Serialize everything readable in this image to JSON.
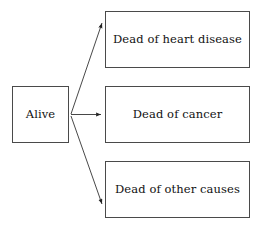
{
  "diagram": {
    "background_color": "#ffffff",
    "line_color": "#333333",
    "border_color": "#4a4a4a",
    "text_color": "#111111",
    "nodes": [
      {
        "id": "alive",
        "label": "Alive",
        "x": 12,
        "y": 86,
        "w": 57,
        "h": 57
      },
      {
        "id": "heart",
        "label": "Dead of heart disease",
        "x": 105,
        "y": 11,
        "w": 145,
        "h": 57
      },
      {
        "id": "cancer",
        "label": "Dead of cancer",
        "x": 105,
        "y": 86,
        "w": 145,
        "h": 57
      },
      {
        "id": "other",
        "label": "Dead of other causes",
        "x": 105,
        "y": 161,
        "w": 145,
        "h": 57
      }
    ],
    "edges": [
      {
        "id": "alive-to-heart",
        "from": "alive",
        "to": "heart",
        "x1": 71,
        "y1": 114,
        "x2": 103,
        "y2": 22
      },
      {
        "id": "alive-to-cancer",
        "from": "alive",
        "to": "cancer",
        "x1": 71,
        "y1": 114,
        "x2": 103,
        "y2": 114
      },
      {
        "id": "alive-to-other",
        "from": "alive",
        "to": "other",
        "x1": 71,
        "y1": 116,
        "x2": 103,
        "y2": 205
      }
    ]
  }
}
